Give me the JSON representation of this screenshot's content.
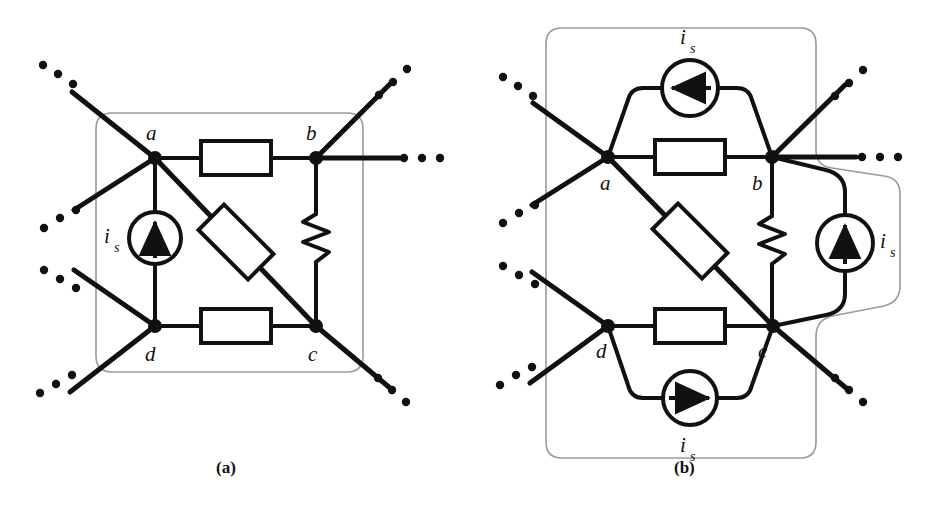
{
  "figure": {
    "title": "",
    "background_color": "#ffffff",
    "line_color": "#111111",
    "boundary_color": "#999999",
    "width": 948,
    "height": 524
  },
  "panels": [
    {
      "id": "a",
      "caption": "(a)",
      "caption_x": 228,
      "caption_y": 470,
      "boundary": "rounded-rect",
      "nodes": [
        {
          "name": "a",
          "label": "a",
          "x": 155,
          "y": 158,
          "label_x": 152,
          "label_y": 133
        },
        {
          "name": "b",
          "label": "b",
          "x": 316,
          "y": 158,
          "label_x": 310,
          "label_y": 133
        },
        {
          "name": "c",
          "label": "c",
          "x": 316,
          "y": 326,
          "label_x": 312,
          "label_y": 356
        },
        {
          "name": "d",
          "label": "d",
          "x": 155,
          "y": 326,
          "label_x": 150,
          "label_y": 356
        }
      ],
      "sources": [
        {
          "name": "current-source-ad",
          "label": "i",
          "sublabel": "s",
          "cx": 155,
          "cy": 238,
          "r": 26,
          "arrow": "up",
          "label_x": 112,
          "label_y": 238
        }
      ],
      "resistors": [
        {
          "name": "resistor-ab",
          "style": "box",
          "orientation": "horizontal",
          "cx": 236,
          "cy": 158
        },
        {
          "name": "resistor-ac",
          "style": "box",
          "orientation": "diagonal",
          "cx": 236,
          "cy": 242
        },
        {
          "name": "resistor-dc",
          "style": "box",
          "orientation": "horizontal",
          "cx": 236,
          "cy": 326
        },
        {
          "name": "resistor-bc",
          "style": "zigzag",
          "orientation": "vertical",
          "cx": 316,
          "cy": 238
        }
      ],
      "ellipses": [
        {
          "name": "ellipsis-upper-left"
        },
        {
          "name": "ellipsis-mid-left"
        },
        {
          "name": "ellipsis-lower-left"
        },
        {
          "name": "ellipsis-upper-right"
        },
        {
          "name": "ellipsis-mid-right"
        },
        {
          "name": "ellipsis-lower-right"
        }
      ]
    },
    {
      "id": "b",
      "caption": "(b)",
      "caption_x": 686,
      "caption_y": 470,
      "boundary": "rounded-rect-with-bulge",
      "nodes": [
        {
          "name": "a",
          "label": "a",
          "x": 608,
          "y": 157,
          "label_x": 604,
          "label_y": 184
        },
        {
          "name": "b",
          "label": "b",
          "x": 772,
          "y": 157,
          "label_x": 757,
          "label_y": 184
        },
        {
          "name": "c",
          "label": "c",
          "x": 773,
          "y": 326,
          "label_x": 762,
          "label_y": 354
        },
        {
          "name": "d",
          "label": "d",
          "x": 608,
          "y": 326,
          "label_x": 600,
          "label_y": 354
        }
      ],
      "sources": [
        {
          "name": "current-source-top",
          "label": "i",
          "sublabel": "s",
          "cx": 690,
          "cy": 88,
          "r": 28,
          "arrow": "left",
          "label_x": 686,
          "label_y": 36
        },
        {
          "name": "current-source-bottom",
          "label": "i",
          "sublabel": "s",
          "cx": 690,
          "cy": 398,
          "r": 27,
          "arrow": "right",
          "label_x": 686,
          "label_y": 448
        },
        {
          "name": "current-source-right",
          "label": "i",
          "sublabel": "s",
          "cx": 845,
          "cy": 243,
          "r": 28,
          "arrow": "up",
          "label_x": 884,
          "label_y": 243
        }
      ],
      "resistors": [
        {
          "name": "resistor-ab",
          "style": "box",
          "orientation": "horizontal",
          "cx": 690,
          "cy": 157
        },
        {
          "name": "resistor-ac",
          "style": "box",
          "orientation": "diagonal",
          "cx": 690,
          "cy": 241
        },
        {
          "name": "resistor-dc",
          "style": "box",
          "orientation": "horizontal",
          "cx": 690,
          "cy": 326
        },
        {
          "name": "resistor-bc",
          "style": "zigzag",
          "orientation": "vertical",
          "cx": 772,
          "cy": 240
        }
      ],
      "ellipses": [
        {
          "name": "ellipsis-upper-left"
        },
        {
          "name": "ellipsis-mid-left"
        },
        {
          "name": "ellipsis-lower-left"
        },
        {
          "name": "ellipsis-upper-right"
        },
        {
          "name": "ellipsis-mid-right"
        },
        {
          "name": "ellipsis-lower-right"
        }
      ]
    }
  ]
}
